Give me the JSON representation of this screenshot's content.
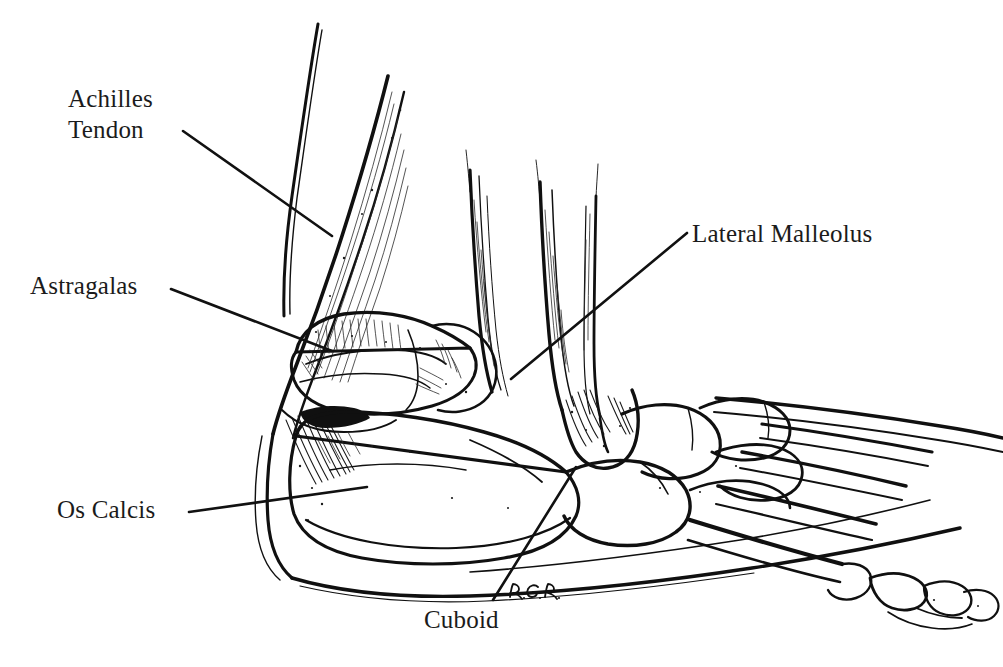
{
  "figure": {
    "kind": "anatomical-line-illustration",
    "style": "pen-and-ink hatched medical illustration",
    "background_color": "#ffffff",
    "ink_color": "#101010",
    "label_color": "#1b1b1b",
    "width": 1003,
    "height": 667
  },
  "labels": [
    {
      "id": "achilles-tendon",
      "text": "Achilles\nTendon",
      "lines": [
        "Achilles",
        "Tendon"
      ],
      "x": 68,
      "y": 84,
      "leader": {
        "x1": 183,
        "y1": 131,
        "x2": 332,
        "y2": 236
      }
    },
    {
      "id": "astragalas",
      "text": "Astragalas",
      "lines": [
        "Astragalas"
      ],
      "x": 30,
      "y": 271,
      "leader": {
        "x1": 171,
        "y1": 289,
        "x2": 332,
        "y2": 351
      }
    },
    {
      "id": "lateral-malleolus",
      "text": "Lateral Malleolus",
      "lines": [
        "Lateral Malleolus"
      ],
      "x": 692,
      "y": 219,
      "leader": {
        "x1": 687,
        "y1": 233,
        "x2": 511,
        "y2": 379
      }
    },
    {
      "id": "os-calcis",
      "text": "Os Calcis",
      "lines": [
        "Os Calcis"
      ],
      "x": 57,
      "y": 495,
      "leader": {
        "x1": 189,
        "y1": 512,
        "x2": 367,
        "y2": 487
      }
    },
    {
      "id": "cuboid",
      "text": "Cuboid",
      "lines": [
        "Cuboid"
      ],
      "x": 424,
      "y": 605,
      "leader": {
        "x1": 576,
        "y1": 467,
        "x2": 493,
        "y2": 600
      }
    }
  ],
  "signature": {
    "id": "artist-monogram",
    "text": "R.G.R.",
    "x": 508,
    "y": 583,
    "description": "handwritten artist initials monogram"
  },
  "top_crop_remnant": {
    "visible": true,
    "text": "                                                        ",
    "note": "faint sliver of cut-off text along the very top edge of the scan"
  },
  "anatomy_parts": [
    {
      "id": "tibia",
      "label": "tibia shaft"
    },
    {
      "id": "fibula",
      "label": "fibula shaft"
    },
    {
      "id": "achilles-tendon-band",
      "label": "Achilles tendon"
    },
    {
      "id": "astragalus",
      "label": "astragalus (talus)"
    },
    {
      "id": "os-calcis",
      "label": "os calcis (calcaneus)"
    },
    {
      "id": "lateral-malleolus",
      "label": "lateral malleolus"
    },
    {
      "id": "cuboid",
      "label": "cuboid"
    },
    {
      "id": "navicular",
      "label": "navicular"
    },
    {
      "id": "cuneiforms",
      "label": "cuneiform bones"
    },
    {
      "id": "metatarsals",
      "label": "metatarsals"
    },
    {
      "id": "phalanges",
      "label": "phalanges"
    },
    {
      "id": "sole-contour",
      "label": "plantar / sole contour"
    }
  ]
}
